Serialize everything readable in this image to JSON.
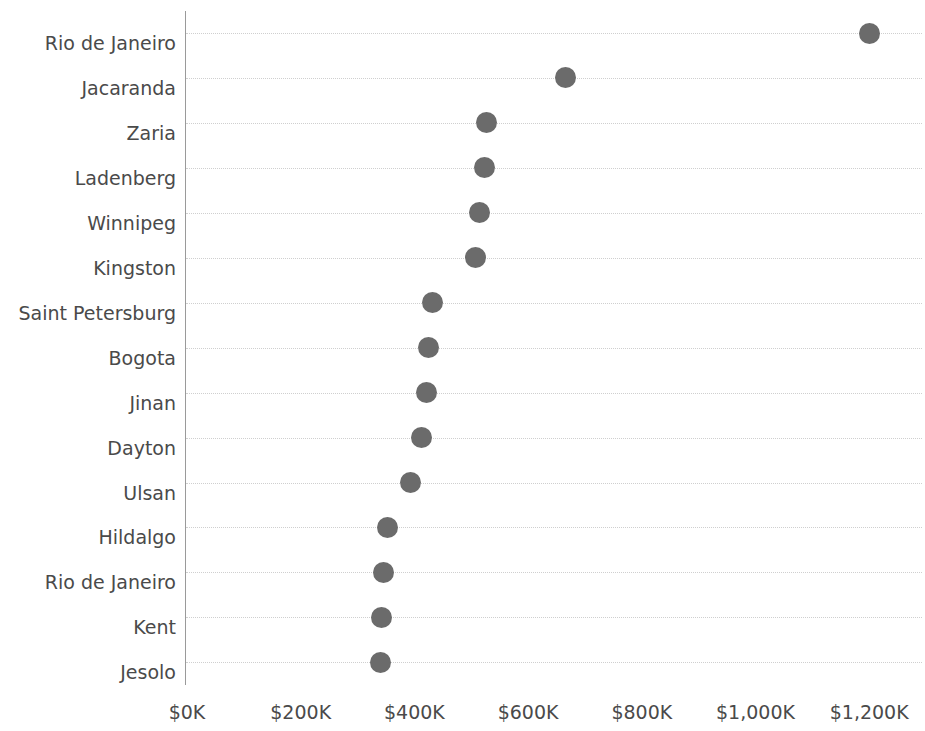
{
  "chart_data": {
    "type": "scatter",
    "title": "",
    "subtitle": "",
    "xlabel": "",
    "ylabel": "",
    "orientation": "horizontal",
    "grid": "horizontal-dotted",
    "legend": "none",
    "marker": {
      "shape": "circle",
      "color": "#6b6b6b",
      "size_px": 21
    },
    "xlim": [
      -30000,
      1275000
    ],
    "xticks": [
      0,
      200000,
      400000,
      600000,
      800000,
      1000000,
      1200000
    ],
    "xtick_labels": [
      "$0K",
      "$200K",
      "$400K",
      "$600K",
      "$800K",
      "$1,000K",
      "$1,200K"
    ],
    "categories": [
      "Rio de Janeiro",
      "Jacaranda",
      "Zaria",
      "Ladenberg",
      "Winnipeg",
      "Kingston",
      "Saint Petersburg",
      "Bogota",
      "Jinan",
      "Dayton",
      "Ulsan",
      "Hildalgo",
      "Rio de Janeiro",
      "Kent",
      "Jesolo"
    ],
    "values": [
      1200000,
      665000,
      527000,
      524000,
      514000,
      508000,
      431000,
      424000,
      422000,
      413000,
      394000,
      352000,
      345000,
      343000,
      341000
    ],
    "value_labels": [
      "$1,200K",
      "$665K",
      "$527K",
      "$524K",
      "$514K",
      "$508K",
      "$431K",
      "$424K",
      "$422K",
      "$413K",
      "$394K",
      "$352K",
      "$345K",
      "$343K",
      "$341K"
    ]
  },
  "axes": {
    "y_axis_line_color": "#9a9a9a",
    "gridline_color": "#cfcfcf",
    "tick_label_color": "#4a4a4a"
  }
}
